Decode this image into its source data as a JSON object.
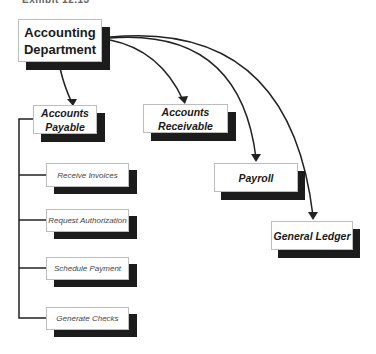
{
  "caption": "Exhibit 12.13",
  "root": {
    "label_line1": "Accounting",
    "label_line2": "Department"
  },
  "departments": [
    {
      "id": "accounts-payable",
      "line1": "Accounts",
      "line2": "Payable"
    },
    {
      "id": "accounts-receivable",
      "line1": "Accounts",
      "line2": "Receivable"
    },
    {
      "id": "payroll",
      "line1": "Payroll",
      "line2": ""
    },
    {
      "id": "general-ledger",
      "line1": "General Ledger",
      "line2": ""
    }
  ],
  "payable_steps": [
    {
      "label": "Receive Invoices"
    },
    {
      "label": "Request Authorization"
    },
    {
      "label": "Schedule Payment"
    },
    {
      "label": "Generate Checks"
    }
  ],
  "colors": {
    "line": "#222222",
    "shadow": "#1c1c1c",
    "box_border": "#bdbdbd"
  }
}
